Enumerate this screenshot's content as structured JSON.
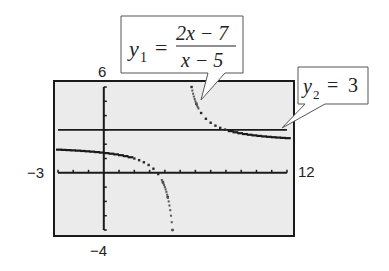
{
  "chart_data": {
    "type": "line",
    "title": "",
    "window": {
      "xmin": -3,
      "xmax": 12,
      "ymin": -4,
      "ymax": 6,
      "xscale": 1,
      "yscale": 1
    },
    "tick_labels": {
      "xmin": "−3",
      "xmax": "12",
      "ymin": "−4",
      "ymax": "6"
    },
    "series": [
      {
        "name": "y1",
        "label_var": "y",
        "label_sub": "1",
        "numerator": "2x − 7",
        "denominator": "x − 5",
        "expression": "(2x-7)/(x-5)",
        "style": "dotted",
        "vertical_asymptote": 5,
        "horizontal_asymptote": 3
      },
      {
        "name": "y2",
        "label_var": "y",
        "label_sub": "2",
        "rhs": "3",
        "expression": "3",
        "style": "solid"
      }
    ],
    "background": "#ebebeb",
    "grid": false,
    "legend": "callout boxes"
  }
}
